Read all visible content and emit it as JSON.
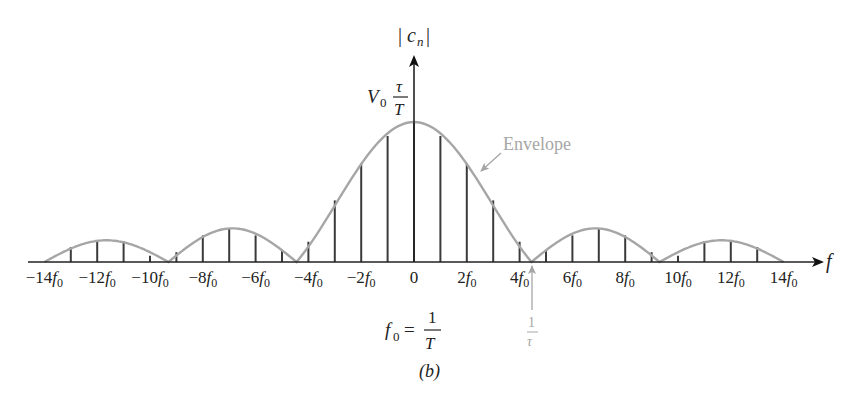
{
  "figure": {
    "caption": "(b)",
    "y_axis_label": "|c_n|",
    "x_axis_label": "f",
    "peak_label": {
      "main": "V",
      "sub": "0",
      "frac_num": "τ",
      "frac_den": "T"
    },
    "f0_definition": {
      "lhs_main": "f",
      "lhs_sub": "0",
      "eq": "=",
      "num": "1",
      "den": "T"
    },
    "zero_marker": {
      "num": "1",
      "den": "τ"
    },
    "envelope_label": "Envelope",
    "colors": {
      "axis": "#222222",
      "lines": "#3a3a3a",
      "envelope": "#a6a6a6",
      "annotation": "#a6a6a6"
    }
  },
  "chart_data": {
    "type": "bar",
    "title": "",
    "subtitle": "(b)",
    "xlabel": "f",
    "ylabel": "|c_n|",
    "x": [
      -14,
      -13,
      -12,
      -11,
      -10,
      -9,
      -8,
      -7,
      -6,
      -5,
      -4,
      -3,
      -2,
      -1,
      0,
      1,
      2,
      3,
      4,
      5,
      6,
      7,
      8,
      9,
      10,
      11,
      12,
      13,
      14
    ],
    "values": [
      0,
      0.107,
      0.15,
      0.15,
      0.045,
      0.07,
      0.19,
      0.236,
      0.19,
      0.085,
      0.145,
      0.44,
      0.705,
      0.9,
      1,
      0.9,
      0.705,
      0.44,
      0.145,
      0.085,
      0.19,
      0.236,
      0.19,
      0.07,
      0.045,
      0.15,
      0.15,
      0.107,
      0
    ],
    "envelope_zeros": [
      -14,
      -9.3,
      -4.45,
      4.45,
      9.3,
      14
    ],
    "tick_labels": [
      {
        "n": -14,
        "text": "−14",
        "sub": "f0"
      },
      {
        "n": -12,
        "text": "−12",
        "sub": "f0"
      },
      {
        "n": -10,
        "text": "−10",
        "sub": "f0"
      },
      {
        "n": -8,
        "text": "−8",
        "sub": "f0"
      },
      {
        "n": -6,
        "text": "−6",
        "sub": "f0"
      },
      {
        "n": -4,
        "text": "−4",
        "sub": "f0"
      },
      {
        "n": -2,
        "text": "−2",
        "sub": "f0"
      },
      {
        "n": 0,
        "text": "0",
        "sub": ""
      },
      {
        "n": 2,
        "text": "2",
        "sub": "f0"
      },
      {
        "n": 4,
        "text": "4",
        "sub": "f0"
      },
      {
        "n": 6,
        "text": "6",
        "sub": "f0"
      },
      {
        "n": 8,
        "text": "8",
        "sub": "f0"
      },
      {
        "n": 10,
        "text": "10",
        "sub": "f0"
      },
      {
        "n": 12,
        "text": "12",
        "sub": "f0"
      },
      {
        "n": 14,
        "text": "14",
        "sub": "f0"
      }
    ],
    "ylim": [
      0,
      1
    ],
    "peak_value_label": "V0 τ/T",
    "grid": false,
    "legend": "none"
  }
}
